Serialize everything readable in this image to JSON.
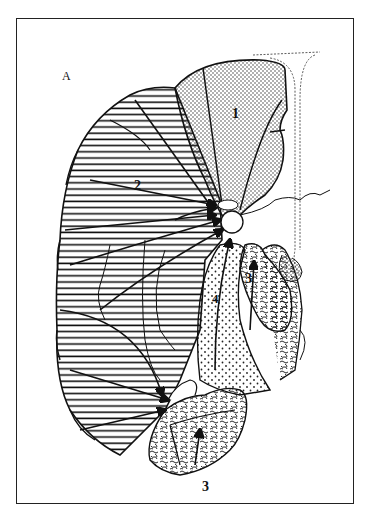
{
  "figure": {
    "panel_label": "A",
    "regions": [
      {
        "id": "1",
        "label": "1",
        "pattern": "fine-dots"
      },
      {
        "id": "2",
        "label": "2",
        "pattern": "horizontal-lines"
      },
      {
        "id": "3a",
        "label": "3",
        "pattern": "vermiform"
      },
      {
        "id": "3b",
        "label": "3",
        "pattern": "vermiform"
      },
      {
        "id": "4",
        "label": "4",
        "pattern": "coarse-dots"
      }
    ],
    "colors": {
      "ink": "#111111",
      "background": "#ffffff"
    }
  }
}
